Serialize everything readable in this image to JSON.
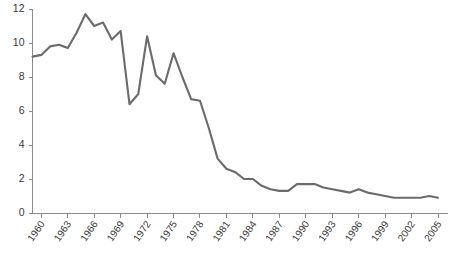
{
  "chart_data": {
    "type": "line",
    "title": "",
    "subtitle": "",
    "xlabel": "",
    "ylabel": "",
    "xlim": [
      1959,
      2005
    ],
    "ylim": [
      0,
      12
    ],
    "grid": false,
    "legend": false,
    "legend_position": "none",
    "series_color": "#6b6b6b",
    "axis_color": "#8a8a8a",
    "label_color": "#3a3a3a",
    "y_ticks": [
      0,
      2,
      4,
      6,
      8,
      10,
      12
    ],
    "y_tick_labels": [
      "0",
      "2",
      "4",
      "6",
      "8",
      "10",
      "12"
    ],
    "x_tick_values": [
      1960,
      1963,
      1966,
      1969,
      1972,
      1975,
      1978,
      1981,
      1984,
      1987,
      1990,
      1993,
      1996,
      1999,
      2002,
      2005
    ],
    "x_tick_labels": [
      "1960",
      "1963",
      "1966",
      "1969",
      "1972",
      "1975",
      "1978",
      "1981",
      "1984",
      "1987",
      "1990",
      "1993",
      "1996",
      "1999",
      "2002",
      "2005"
    ],
    "x": [
      1959,
      1960,
      1961,
      1962,
      1963,
      1964,
      1965,
      1966,
      1967,
      1968,
      1969,
      1970,
      1971,
      1972,
      1973,
      1974,
      1975,
      1976,
      1977,
      1978,
      1979,
      1980,
      1981,
      1982,
      1983,
      1984,
      1985,
      1986,
      1987,
      1988,
      1989,
      1990,
      1991,
      1992,
      1993,
      1994,
      1995,
      1996,
      1997,
      1998,
      1999,
      2000,
      2001,
      2002,
      2003,
      2004,
      2005
    ],
    "series": [
      {
        "name": "value",
        "values": [
          9.2,
          9.3,
          9.8,
          9.9,
          9.7,
          10.6,
          11.7,
          11.0,
          11.2,
          10.2,
          10.7,
          6.4,
          7.0,
          10.4,
          8.1,
          7.6,
          9.4,
          8.0,
          6.7,
          6.6,
          5.0,
          3.2,
          2.6,
          2.4,
          2.0,
          2.0,
          1.6,
          1.4,
          1.3,
          1.3,
          1.7,
          1.7,
          1.7,
          1.5,
          1.4,
          1.3,
          1.2,
          1.4,
          1.2,
          1.1,
          1.0,
          0.9,
          0.9,
          0.9,
          0.9,
          1.0,
          0.9
        ]
      }
    ]
  },
  "axes": {
    "y_axis_name": "y-axis",
    "x_axis_name": "x-axis"
  }
}
